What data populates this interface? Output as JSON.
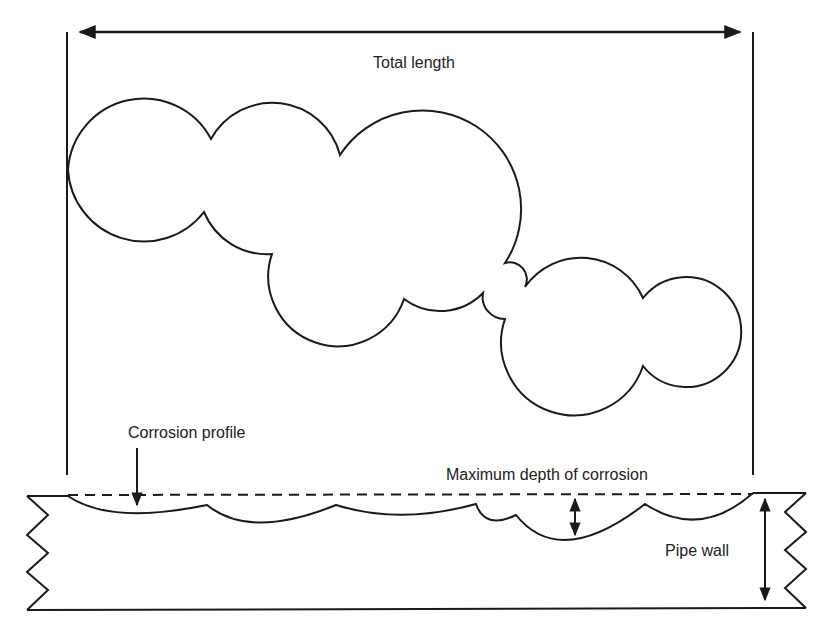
{
  "diagram": {
    "labels": {
      "total_length": "Total length",
      "corrosion_profile": "Corrosion profile",
      "max_depth": "Maximum depth of corrosion",
      "pipe_wall": "Pipe wall"
    },
    "elements": [
      {
        "id": "total-length-dimension",
        "type": "double-arrow",
        "orientation": "horizontal"
      },
      {
        "id": "corrosion-pit-cluster",
        "type": "outline",
        "description": "Cluster of overlapping circular pits (plan view)"
      },
      {
        "id": "pipe-wall-section",
        "type": "cross-section",
        "description": "Pipe wall with break lines on both ends"
      },
      {
        "id": "original-surface",
        "type": "dashed-line"
      },
      {
        "id": "corrosion-profile-curve",
        "type": "scalloped-curve"
      },
      {
        "id": "max-depth-dimension",
        "type": "double-arrow",
        "orientation": "vertical"
      },
      {
        "id": "pipe-wall-dimension",
        "type": "double-arrow",
        "orientation": "vertical"
      }
    ],
    "colors": {
      "line": "#1a1a1a",
      "background": "#ffffff",
      "text": "#222222"
    }
  }
}
